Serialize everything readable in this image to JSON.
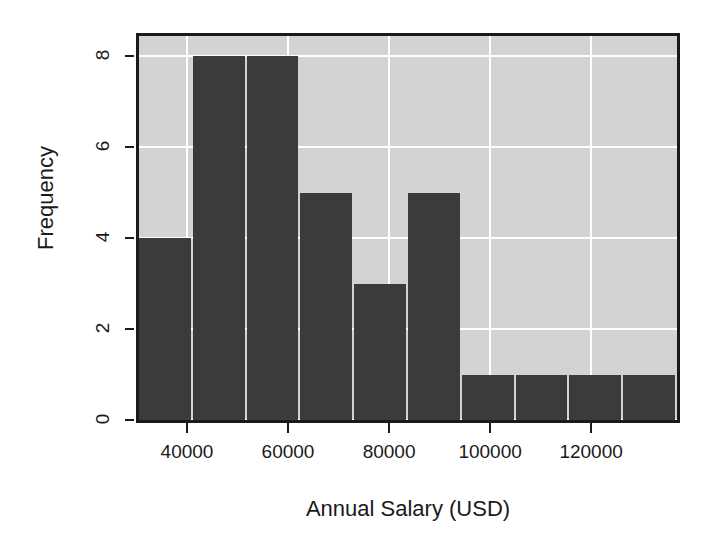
{
  "chart_data": {
    "type": "bar",
    "title": "",
    "subtitle": "",
    "xlabel": "Annual Salary (USD)",
    "ylabel": "Frequency",
    "xlim": [
      30500,
      137000
    ],
    "ylim": [
      0,
      8.45
    ],
    "grid": true,
    "legend": null,
    "bin_width": 10650,
    "bin_edges": [
      30500,
      41150,
      51800,
      62450,
      73100,
      83750,
      94400,
      105050,
      115700,
      126350,
      137000
    ],
    "categories": [
      "30500-41150",
      "41150-51800",
      "51800-62450",
      "62450-73100",
      "73100-83750",
      "83750-94400",
      "94400-105050",
      "105050-115700",
      "115700-126350",
      "126350-137000"
    ],
    "values": [
      4,
      8,
      8,
      5,
      3,
      5,
      1,
      1,
      1,
      1
    ],
    "total_count": 37,
    "xticks": [
      40000,
      60000,
      80000,
      100000,
      120000
    ],
    "xtick_labels": [
      "40000",
      "60000",
      "80000",
      "100000",
      "120000"
    ],
    "yticks": [
      0,
      2,
      4,
      6,
      8
    ],
    "ytick_labels": [
      "0",
      "2",
      "4",
      "6",
      "8"
    ],
    "colors": {
      "panel_background": "#d3d3d3",
      "gridline": "#ffffff",
      "bar_fill": "#3b3b3b",
      "axis": "#1a1a1a",
      "figure_background": "#ffffff",
      "text": "#1a1a1a"
    }
  }
}
